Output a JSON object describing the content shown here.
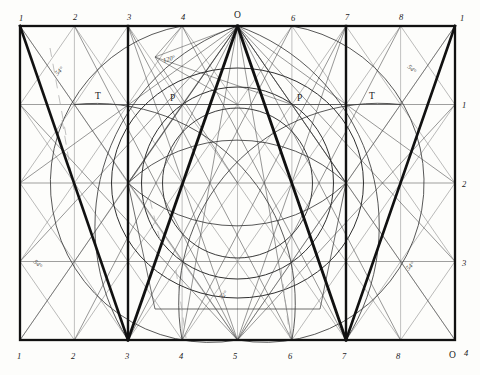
{
  "figure": {
    "type": "technical-line-diagram",
    "frame": {
      "x": 20,
      "y": 26,
      "width": 435,
      "height": 314
    },
    "colors": {
      "paper": "#fdfdfb",
      "ink_heavy": "#111111",
      "ink_medium": "#2b2b2b",
      "ink_light": "#555555",
      "ink_faint": "#8a8a8a"
    }
  },
  "grid": {
    "columns": 8,
    "rows": 4,
    "column_step": 54.375,
    "row_step": 78.5
  },
  "labels": {
    "top": [
      {
        "text": "1",
        "x": 19,
        "y": 14
      },
      {
        "text": "2",
        "x": 73,
        "y": 13
      },
      {
        "text": "3",
        "x": 127,
        "y": 13
      },
      {
        "text": "4",
        "x": 181,
        "y": 13
      },
      {
        "text": "O",
        "x": 234,
        "y": 11
      },
      {
        "text": "6",
        "x": 291,
        "y": 14
      },
      {
        "text": "7",
        "x": 345,
        "y": 13
      },
      {
        "text": "8",
        "x": 399,
        "y": 13
      },
      {
        "text": "1",
        "x": 455,
        "y": 14
      }
    ],
    "bottom": [
      {
        "text": "1",
        "x": 17,
        "y": 352
      },
      {
        "text": "2",
        "x": 71,
        "y": 352
      },
      {
        "text": "3",
        "x": 125,
        "y": 352
      },
      {
        "text": "4",
        "x": 179,
        "y": 352
      },
      {
        "text": "5",
        "x": 233,
        "y": 352
      },
      {
        "text": "6",
        "x": 288,
        "y": 352
      },
      {
        "text": "7",
        "x": 342,
        "y": 352
      },
      {
        "text": "8",
        "x": 396,
        "y": 352
      },
      {
        "text": "O",
        "x": 449,
        "y": 352
      },
      {
        "text": "4",
        "x": 464,
        "y": 349
      }
    ],
    "right": [
      {
        "text": "1",
        "x": 462,
        "y": 101
      },
      {
        "text": "2",
        "x": 462,
        "y": 180
      },
      {
        "text": "3",
        "x": 462,
        "y": 259
      }
    ],
    "points": [
      {
        "text": "T",
        "x": 95,
        "y": 92
      },
      {
        "text": "P",
        "x": 170,
        "y": 94
      },
      {
        "text": "P",
        "x": 297,
        "y": 94
      },
      {
        "text": "T",
        "x": 369,
        "y": 92
      }
    ],
    "angles": [
      {
        "text": "54°",
        "x": 55,
        "y": 68,
        "rotate": -45
      },
      {
        "text": "54°",
        "x": 407,
        "y": 66,
        "rotate": 45
      },
      {
        "text": "54°",
        "x": 33,
        "y": 261,
        "rotate": 45
      },
      {
        "text": "54°",
        "x": 406,
        "y": 263,
        "rotate": -45
      },
      {
        "text": "120°",
        "x": 163,
        "y": 56,
        "rotate": -16
      },
      {
        "text": "72°",
        "x": 219,
        "y": 292,
        "rotate": -45
      }
    ]
  },
  "geometry": {
    "heavy_lines": [
      {
        "name": "frame-top",
        "x1": 20,
        "y1": 26,
        "x2": 455,
        "y2": 26
      },
      {
        "name": "frame-bottom",
        "x1": 20,
        "y1": 340,
        "x2": 455,
        "y2": 340
      },
      {
        "name": "frame-left",
        "x1": 20,
        "y1": 26,
        "x2": 20,
        "y2": 340
      },
      {
        "name": "frame-right",
        "x1": 455,
        "y1": 26,
        "x2": 455,
        "y2": 340
      },
      {
        "name": "vertical-col3",
        "x1": 128,
        "y1": 26,
        "x2": 128,
        "y2": 340
      },
      {
        "name": "vertical-col7",
        "x1": 346,
        "y1": 26,
        "x2": 346,
        "y2": 340
      },
      {
        "name": "apex-left",
        "x1": 237,
        "y1": 26,
        "x2": 128,
        "y2": 340
      },
      {
        "name": "apex-right",
        "x1": 237,
        "y1": 26,
        "x2": 346,
        "y2": 340
      },
      {
        "name": "diag-upper-left",
        "x1": 20,
        "y1": 26,
        "x2": 128,
        "y2": 340
      },
      {
        "name": "diag-upper-right",
        "x1": 455,
        "y1": 26,
        "x2": 346,
        "y2": 340
      }
    ],
    "circles": [
      {
        "name": "inner-circle",
        "cx": 237,
        "cy": 183,
        "r": 75
      },
      {
        "name": "mid-circle",
        "cx": 237,
        "cy": 183,
        "r": 96
      },
      {
        "name": "outer-ellipse",
        "cx": 237,
        "cy": 183,
        "rx": 126,
        "ry": 115
      }
    ]
  }
}
